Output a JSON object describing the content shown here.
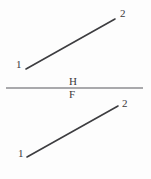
{
  "figure": {
    "background_color": "#fdfdfd",
    "width": 151,
    "height": 179,
    "line_color": "#3d3d40",
    "fold_line_color": "#8d8d90",
    "text_color": "#3a3a3c"
  },
  "fold_line": {
    "name": "H-F reference line",
    "x1": 6,
    "y1": 88,
    "x2": 143,
    "y2": 88,
    "upper_label": "H",
    "lower_label": "F"
  },
  "views": [
    {
      "view": "horizontal",
      "name": "top-view",
      "segment": {
        "x1": 26,
        "y1": 69,
        "x2": 115,
        "y2": 19
      },
      "endpoints": [
        {
          "label": "1",
          "x": 26,
          "y": 69
        },
        {
          "label": "2",
          "x": 115,
          "y": 19
        }
      ]
    },
    {
      "view": "frontal",
      "name": "front-view",
      "segment": {
        "x1": 27,
        "y1": 157,
        "x2": 118,
        "y2": 106
      },
      "endpoints": [
        {
          "label": "1",
          "x": 27,
          "y": 157
        },
        {
          "label": "2",
          "x": 118,
          "y": 106
        }
      ]
    }
  ],
  "chart_data": {
    "type": "line",
    "xlabel": "",
    "ylabel": "",
    "xlim": [
      0,
      151
    ],
    "ylim": [
      179,
      0
    ],
    "grid": false,
    "legend": "none",
    "annotations": [
      "H",
      "F",
      "1",
      "2",
      "1",
      "2"
    ],
    "series": [
      {
        "name": "top-view-line-1-2",
        "x": [
          26,
          115
        ],
        "y": [
          69,
          19
        ]
      },
      {
        "name": "front-view-line-1-2",
        "x": [
          27,
          118
        ],
        "y": [
          157,
          106
        ]
      },
      {
        "name": "fold-line-HF",
        "x": [
          6,
          143
        ],
        "y": [
          88,
          88
        ]
      }
    ]
  }
}
